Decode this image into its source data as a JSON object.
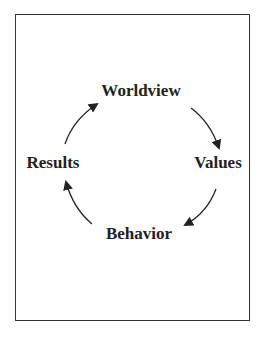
{
  "diagram": {
    "type": "cycle",
    "nodes": [
      {
        "id": "worldview",
        "label": "Worldview"
      },
      {
        "id": "values",
        "label": "Values"
      },
      {
        "id": "behavior",
        "label": "Behavior"
      },
      {
        "id": "results",
        "label": "Results"
      }
    ],
    "edges": [
      {
        "from": "worldview",
        "to": "values"
      },
      {
        "from": "values",
        "to": "behavior"
      },
      {
        "from": "behavior",
        "to": "results"
      },
      {
        "from": "results",
        "to": "worldview"
      }
    ],
    "colors": {
      "stroke": "#222222",
      "border": "#333333",
      "background": "#ffffff"
    }
  }
}
